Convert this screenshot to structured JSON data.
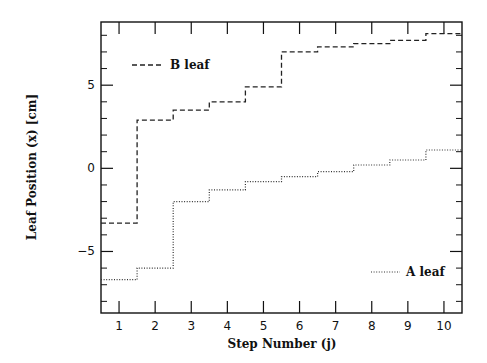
{
  "chart_data": {
    "type": "line",
    "step": true,
    "title": "",
    "xlabel": "Step Number (j)",
    "ylabel": "Leaf Position (x) [cm]",
    "xlim": [
      0.5,
      10.5
    ],
    "ylim": [
      -8.7,
      8.8
    ],
    "x": [
      1,
      2,
      3,
      4,
      5,
      6,
      7,
      8,
      9,
      10
    ],
    "xticks": [
      1,
      2,
      3,
      4,
      5,
      6,
      7,
      8,
      9,
      10
    ],
    "xtick_labels": [
      "1",
      "2",
      "3",
      "4",
      "5",
      "6",
      "7",
      "8",
      "9",
      "10"
    ],
    "yticks_major": [
      -5,
      0,
      5
    ],
    "ytick_labels": [
      "-5",
      "0",
      "5"
    ],
    "yticks_minor": [
      -8,
      -7,
      -6,
      -4,
      -3,
      -2,
      -1,
      1,
      2,
      3,
      4,
      6,
      7,
      8
    ],
    "grid": false,
    "series": [
      {
        "name": "B leaf",
        "line_style": "dashed",
        "color": "#222222",
        "values": [
          -3.3,
          2.9,
          3.5,
          4.0,
          4.9,
          7.0,
          7.3,
          7.5,
          7.7,
          8.1
        ]
      },
      {
        "name": "A leaf",
        "line_style": "dotted",
        "color": "#333333",
        "values": [
          -6.7,
          -6.0,
          -2.0,
          -1.3,
          -0.8,
          -0.5,
          -0.2,
          0.2,
          0.5,
          1.1
        ]
      }
    ],
    "legend": [
      {
        "series": "B leaf",
        "position": "upper-left"
      },
      {
        "series": "A leaf",
        "position": "lower-right"
      }
    ]
  }
}
